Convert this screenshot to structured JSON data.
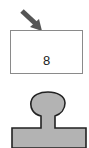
{
  "diagram": {
    "box": {
      "label": "8"
    },
    "arrow": {
      "color": "#555555",
      "direction": "down-right"
    },
    "shape": {
      "fill": "#b3b3b3",
      "stroke": "#222222",
      "type": "keyhole-tab"
    }
  }
}
